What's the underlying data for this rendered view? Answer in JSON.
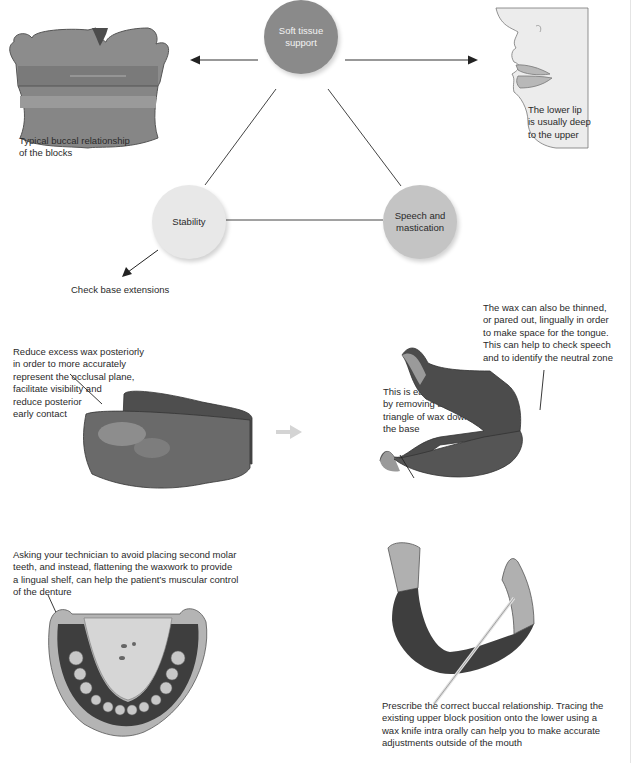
{
  "diagram": {
    "nodes": [
      {
        "id": "soft_tissue",
        "label": "Soft tissue support",
        "fill": "#8a8a8a",
        "text_color": "#f2f2f2"
      },
      {
        "id": "stability",
        "label": "Stability",
        "fill": "#e8e8e8",
        "text_color": "#2a2a2a"
      },
      {
        "id": "speech",
        "label": "Speech and mastication",
        "fill": "#c4c4c4",
        "text_color": "#2a2a2a"
      }
    ],
    "labels": {
      "soft_tissue_l1": "Soft tissue",
      "soft_tissue_l2": "support",
      "stability": "Stability",
      "speech_l1": "Speech and",
      "speech_l2": "mastication"
    },
    "edges": [
      {
        "from": "soft_tissue",
        "to": "stability"
      },
      {
        "from": "soft_tissue",
        "to": "speech"
      },
      {
        "from": "stability",
        "to": "speech"
      }
    ],
    "arrows": [
      {
        "from": "soft_tissue",
        "direction": "left",
        "target": "blocks_illustration"
      },
      {
        "from": "soft_tissue",
        "direction": "right",
        "target": "lip_illustration"
      },
      {
        "from": "stability",
        "direction": "down-left",
        "target": "check_base_caption"
      }
    ]
  },
  "captions": {
    "blocks_l1": "Typical buccal relationship",
    "blocks_l2": "of the blocks",
    "lip_l1": "The lower lip",
    "lip_l2": "is usually deep",
    "lip_l3": "to the upper",
    "check_base": "Check base extensions",
    "reduce_wax": [
      "Reduce excess wax posteriorly",
      "in order to more accurately",
      "represent the occlusal plane,",
      "facilitate visibility and",
      "reduce posterior",
      "early contact"
    ],
    "thinned": [
      "The wax can also be thinned,",
      "or pared out, lingually in order",
      "to make space for the tongue.",
      "This can help to check speech",
      "and to identify the neutral zone"
    ],
    "triangle": [
      "This is easily carried out",
      "by removing a posterior",
      "triangle of wax down to",
      "the base"
    ],
    "technician": [
      "Asking your technician to avoid placing second molar",
      "teeth, and instead, flattening the waxwork to provide",
      "a lingual shelf, can help the patient’s muscular control",
      "of the denture"
    ],
    "prescribe": [
      "Prescribe the correct buccal relationship. Tracing the",
      "existing upper block position onto the lower using a",
      "wax knife intra orally can help you to make accurate",
      "adjustments outside of the mouth"
    ]
  },
  "illustrations": [
    {
      "name": "occlusal-blocks",
      "description": "Upper and lower wax occlusal blocks in buccal view"
    },
    {
      "name": "lip-profile",
      "description": "Profile of lower face showing lips"
    },
    {
      "name": "wax-block-oblique",
      "description": "Lower wax rim oblique view"
    },
    {
      "name": "trimmed-wax-rim",
      "description": "Trimmed lower wax rim with posterior triangle removed"
    },
    {
      "name": "lower-denture-occlusal",
      "description": "Lower denture occlusal view with teeth and lingual shelf"
    },
    {
      "name": "wax-knife-tracing",
      "description": "Lower block with wax knife tracing"
    }
  ],
  "colors": {
    "dark_node": "#8a8a8a",
    "light_node": "#e8e8e8",
    "mid_node": "#c4c4c4",
    "line": "#555555",
    "wax": "#4a4a4a",
    "base": "#a8a8a8"
  }
}
